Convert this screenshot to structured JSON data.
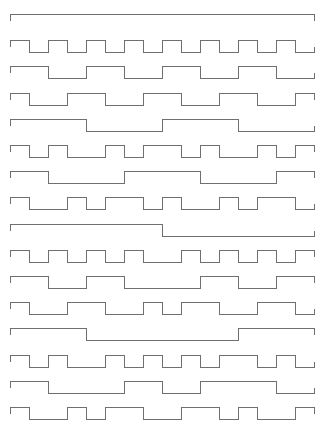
{
  "diagram": {
    "type": "walsh-function-waveforms",
    "stroke_color": "#6f6f6f",
    "background": "#ffffff",
    "layout": {
      "x_start": 10,
      "slot_width": 19,
      "slots": 16,
      "first_row_y": 14,
      "row_spacing": 26.2,
      "amplitude": 12
    },
    "rows": [
      {
        "index": 0,
        "bits": "1111111111111111"
      },
      {
        "index": 1,
        "bits": "1010101010101010"
      },
      {
        "index": 2,
        "bits": "1100110011001100"
      },
      {
        "index": 3,
        "bits": "1001100110011001"
      },
      {
        "index": 4,
        "bits": "1111000011110000"
      },
      {
        "index": 5,
        "bits": "1010010110100101"
      },
      {
        "index": 6,
        "bits": "1100001111000011"
      },
      {
        "index": 7,
        "bits": "1001011010010110"
      },
      {
        "index": 8,
        "bits": "1111111100000000"
      },
      {
        "index": 9,
        "bits": "1010101001010101"
      },
      {
        "index": 10,
        "bits": "1100110000110011"
      },
      {
        "index": 11,
        "bits": "1001100101100110"
      },
      {
        "index": 12,
        "bits": "1111000000001111"
      },
      {
        "index": 13,
        "bits": "1010010101011010"
      },
      {
        "index": 14,
        "bits": "1100001100111100"
      },
      {
        "index": 15,
        "bits": "1001011001101001"
      }
    ]
  }
}
